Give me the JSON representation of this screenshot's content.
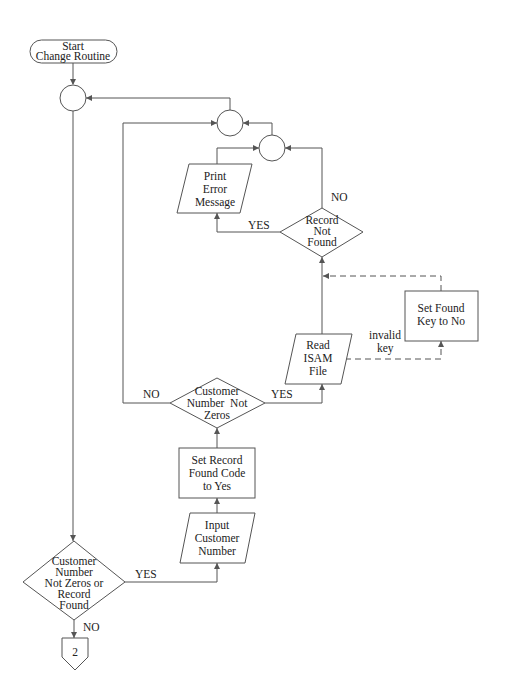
{
  "diagram": {
    "nodes": {
      "start": {
        "type": "terminal",
        "lines": [
          "Start",
          "Change Routine"
        ]
      },
      "connector_1": {
        "type": "connector"
      },
      "connector_2": {
        "type": "connector"
      },
      "connector_3": {
        "type": "connector"
      },
      "print_error": {
        "type": "io",
        "lines": [
          "Print",
          "Error",
          "Message"
        ]
      },
      "record_not_found": {
        "type": "decision",
        "lines": [
          "Record",
          "Not",
          "Found"
        ]
      },
      "set_found_key": {
        "type": "process",
        "lines": [
          "Set Found",
          "Key to No"
        ]
      },
      "read_isam": {
        "type": "io",
        "lines": [
          "Read",
          "ISAM",
          "File"
        ]
      },
      "cust_not_zeros": {
        "type": "decision",
        "lines": [
          "Customer",
          "Number  Not",
          "Zeros"
        ]
      },
      "set_record_found": {
        "type": "process",
        "lines": [
          "Set Record",
          "Found Code",
          "to Yes"
        ]
      },
      "input_customer": {
        "type": "io",
        "lines": [
          "Input",
          "Customer",
          "Number"
        ]
      },
      "main_decision": {
        "type": "decision",
        "lines": [
          "Customer",
          "Number",
          "Not Zeros or",
          "Record",
          "Found"
        ]
      },
      "offpage": {
        "type": "off-page-connector",
        "label": "2"
      }
    },
    "edge_labels": {
      "record_not_found_no": "NO",
      "record_not_found_yes": "YES",
      "invalid_key": [
        "invalid",
        "key"
      ],
      "cust_not_zeros_no": "NO",
      "cust_not_zeros_yes": "YES",
      "main_yes": "YES",
      "main_no": "NO"
    },
    "colors": {
      "stroke": "#555555",
      "text": "#222222",
      "background": "#ffffff"
    }
  }
}
